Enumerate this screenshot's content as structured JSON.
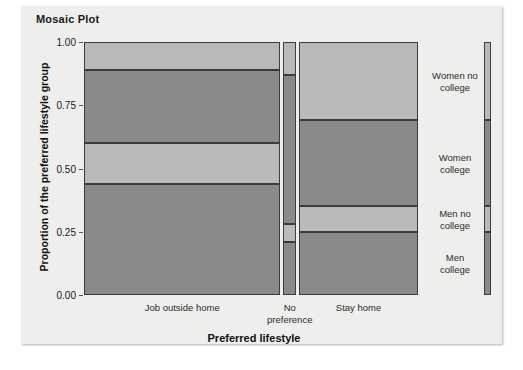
{
  "title": "Mosaic Plot",
  "axes": {
    "ylabel": "Proportion of the preferred lifestyle group",
    "xlabel": "Preferred lifestyle",
    "yticks": [
      "1.00",
      "0.75",
      "0.50",
      "0.25",
      "0.00"
    ],
    "ytick_values": [
      1.0,
      0.75,
      0.5,
      0.25,
      0.0
    ]
  },
  "colors": {
    "light_gray": "#b9b9b7",
    "dark_gray": "#8a8a8a",
    "cell_border": "#3c3c3c",
    "panel_background": "#eeeeec",
    "figure_background": "#ffffff"
  },
  "legend": {
    "labels": [
      "Women no\ncollege",
      "Women\ncollege",
      "Men no\ncollege",
      "Men\ncollege"
    ]
  },
  "chart_data": {
    "type": "mosaic",
    "title": "Mosaic Plot",
    "xlabel": "Preferred lifestyle",
    "ylabel": "Proportion of the preferred lifestyle group",
    "ylim": [
      0.0,
      1.0
    ],
    "grid": false,
    "legend_position": "right",
    "categories": [
      "Job outside home",
      "No preference",
      "Stay home"
    ],
    "column_widths": [
      0.588,
      0.038,
      0.356
    ],
    "series": [
      {
        "name": "Women no college",
        "color": "#b9b9b7",
        "values": [
          0.11,
          0.13,
          0.31
        ]
      },
      {
        "name": "Women college",
        "color": "#8a8a8a",
        "values": [
          0.29,
          0.59,
          0.34
        ]
      },
      {
        "name": "Men no college",
        "color": "#b9b9b7",
        "values": [
          0.16,
          0.07,
          0.1
        ]
      },
      {
        "name": "Men college",
        "color": "#8a8a8a",
        "values": [
          0.44,
          0.21,
          0.25
        ]
      }
    ]
  }
}
